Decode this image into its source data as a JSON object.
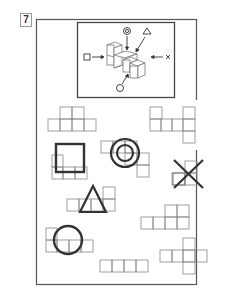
{
  "problem": {
    "number": "7"
  },
  "colors": {
    "frame": "#555555",
    "grid": "#888888",
    "symbol": "#333333",
    "background": "#ffffff"
  },
  "reference_view": {
    "description": "isometric block structure with viewing directions",
    "labels": [
      {
        "symbol": "square",
        "direction": "from-left"
      },
      {
        "symbol": "double-circle",
        "direction": "from-top"
      },
      {
        "symbol": "triangle",
        "direction": "from-top-right"
      },
      {
        "symbol": "x",
        "direction": "from-right"
      },
      {
        "symbol": "circle",
        "direction": "from-bottom-front"
      }
    ]
  },
  "views": [
    {
      "id": "net-1",
      "label": "",
      "cells": [
        [
          1,
          0
        ],
        [
          2,
          0
        ],
        [
          0,
          1
        ],
        [
          1,
          1
        ],
        [
          2,
          1
        ],
        [
          3,
          1
        ]
      ]
    },
    {
      "id": "net-2",
      "label": "",
      "cells": [
        [
          0,
          0
        ],
        [
          3,
          0
        ],
        [
          0,
          1
        ],
        [
          1,
          1
        ],
        [
          2,
          1
        ],
        [
          3,
          1
        ],
        [
          4,
          1
        ],
        [
          4,
          2
        ]
      ]
    },
    {
      "id": "net-square",
      "label": "square",
      "cells": [
        [
          0,
          0
        ],
        [
          0,
          1
        ],
        [
          1,
          1
        ],
        [
          2,
          1
        ]
      ]
    },
    {
      "id": "net-double-circle",
      "label": "double-circle",
      "cells": [
        [
          0,
          0
        ],
        [
          1,
          0
        ],
        [
          2,
          0
        ],
        [
          2,
          1
        ],
        [
          3,
          1
        ],
        [
          3,
          2
        ]
      ]
    },
    {
      "id": "net-x",
      "label": "x",
      "cells": [
        [
          2,
          0
        ],
        [
          0,
          1
        ],
        [
          1,
          1
        ],
        [
          2,
          1
        ]
      ]
    },
    {
      "id": "net-triangle",
      "label": "triangle",
      "cells": [
        [
          3,
          0
        ],
        [
          0,
          1
        ],
        [
          1,
          1
        ],
        [
          2,
          1
        ],
        [
          3,
          1
        ]
      ]
    },
    {
      "id": "net-3",
      "label": "",
      "cells": [
        [
          2,
          0
        ],
        [
          3,
          0
        ],
        [
          0,
          1
        ],
        [
          1,
          1
        ],
        [
          2,
          1
        ],
        [
          3,
          1
        ]
      ]
    },
    {
      "id": "net-circle",
      "label": "circle",
      "cells": [
        [
          0,
          0
        ],
        [
          0,
          1
        ],
        [
          1,
          1
        ],
        [
          2,
          1
        ],
        [
          3,
          1
        ]
      ]
    },
    {
      "id": "net-4",
      "label": "",
      "cells": [
        [
          0,
          0
        ],
        [
          1,
          0
        ],
        [
          2,
          0
        ],
        [
          3,
          0
        ]
      ]
    },
    {
      "id": "net-5",
      "label": "",
      "cells": [
        [
          2,
          0
        ],
        [
          0,
          1
        ],
        [
          1,
          1
        ],
        [
          2,
          1
        ],
        [
          3,
          1
        ],
        [
          2,
          2
        ]
      ]
    }
  ]
}
